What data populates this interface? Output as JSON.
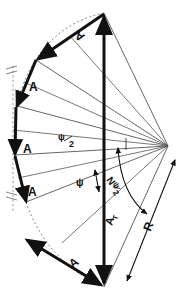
{
  "figure": {
    "type": "geometry-diagram",
    "width": 188,
    "height": 301,
    "background_color": "#ffffff",
    "line_color": "#1a1a1a",
    "thin_line_color": "#555555",
    "dashed_color": "#777777"
  },
  "labels": {
    "segment_top": "A",
    "segment_upper": "A",
    "segment_middle": "A",
    "segment_lower": "A",
    "segment_bottom": "A",
    "chord_total": "A",
    "chord_total_sub": "T",
    "half_angle_num": "ψ",
    "half_angle_den": "2",
    "full_angle": "ψ",
    "total_angle_pre": "N",
    "total_angle_num": "ψ",
    "total_angle_den": "2",
    "radius": "R"
  },
  "geometry": {
    "center": {
      "x": 168,
      "y": 146
    },
    "radius_px": 150,
    "segments": 5,
    "vertices": [
      {
        "x": 104,
        "y": 13
      },
      {
        "x": 36,
        "y": 60
      },
      {
        "x": 17,
        "y": 106
      },
      {
        "x": 15,
        "y": 155
      },
      {
        "x": 26,
        "y": 202
      },
      {
        "x": 104,
        "y": 287
      }
    ],
    "chord_endpoints": [
      {
        "x": 104,
        "y": 13
      },
      {
        "x": 104,
        "y": 287
      }
    ],
    "radius_arrow": [
      {
        "x": 175,
        "y": 160
      },
      {
        "x": 126,
        "y": 282
      }
    ]
  }
}
